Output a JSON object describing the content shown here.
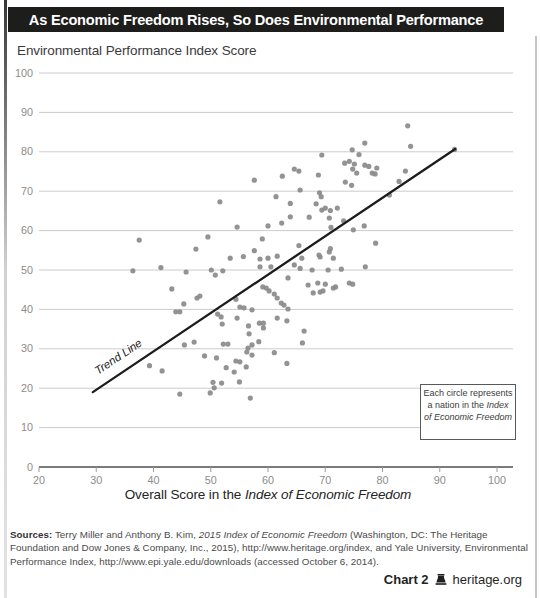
{
  "page": {
    "title": "As Economic Freedom Rises, So Does Environmental Performance",
    "subtitle": "Environmental Performance Index Score",
    "footer": {
      "chart_label": "Chart 2",
      "site": "heritage.org"
    }
  },
  "annotation": {
    "text_plain": "Each circle represents a nation in the ",
    "text_italic": "Index of Economic Freedom"
  },
  "sources": {
    "label": "Sources:",
    "seg1": " Terry Miller and Anthony B. Kim, ",
    "italic1": "2015 Index of Economic Freedom",
    "seg2": " (Washington, DC: The Heritage Foundation and Dow Jones & Company, Inc., 2015), http://www.heritage.org/index, and Yale University, Environmental Performance Index, http://www.epi.yale.edu/downloads (accessed October 6, 2014)."
  },
  "chart_data": {
    "type": "scatter",
    "title": "As Economic Freedom Rises, So Does Environmental Performance",
    "ylabel": "Environmental Performance Index Score",
    "xlabel_plain": "Overall Score in the ",
    "xlabel_italic": "Index of Economic Freedom",
    "xlim": [
      20,
      100
    ],
    "ylim": [
      0,
      100
    ],
    "x_ticks": [
      20,
      30,
      40,
      50,
      60,
      70,
      80,
      90,
      100
    ],
    "y_ticks": [
      0,
      10,
      20,
      30,
      40,
      50,
      60,
      70,
      80,
      90,
      100
    ],
    "grid": "horizontal",
    "legend": "none",
    "point_color": "#8a8a8a",
    "gridline_color": "#cccccc",
    "axis_color": "#4f4f4f",
    "tick_label_color": "#8b8b8b",
    "trend_line": {
      "label": "Trend Line",
      "x1": 29.4,
      "y1": 19.0,
      "x2": 92.7,
      "y2": 80.7,
      "color": "#1c1c1c"
    },
    "points": [
      [
        84.4,
        86.6
      ],
      [
        92.6,
        80.6
      ],
      [
        84.9,
        81.4
      ],
      [
        76.9,
        82.2
      ],
      [
        74.7,
        80.5
      ],
      [
        75.9,
        79.3
      ],
      [
        69.4,
        79.2
      ],
      [
        73.4,
        77.1
      ],
      [
        74.2,
        77.6
      ],
      [
        75.1,
        76.9
      ],
      [
        76.9,
        76.6
      ],
      [
        77.6,
        76.3
      ],
      [
        79,
        75.9
      ],
      [
        64.6,
        75.6
      ],
      [
        65.4,
        75.1
      ],
      [
        74.8,
        75.6
      ],
      [
        75.5,
        74.6
      ],
      [
        78.2,
        74.6
      ],
      [
        78.7,
        74.4
      ],
      [
        84,
        75.1
      ],
      [
        68.8,
        74.1
      ],
      [
        62.5,
        73.8
      ],
      [
        73.5,
        72.3
      ],
      [
        74.6,
        71.5
      ],
      [
        82.9,
        72.5
      ],
      [
        57.6,
        72.8
      ],
      [
        65.6,
        70.3
      ],
      [
        69,
        69.6
      ],
      [
        69.3,
        68.6
      ],
      [
        81.2,
        69
      ],
      [
        61.4,
        68.6
      ],
      [
        63.9,
        66.9
      ],
      [
        68.4,
        66.8
      ],
      [
        51.6,
        67.3
      ],
      [
        70,
        65.7
      ],
      [
        69.4,
        65.2
      ],
      [
        70.9,
        65.1
      ],
      [
        72.1,
        65.7
      ],
      [
        63.9,
        63.5
      ],
      [
        67.2,
        63.4
      ],
      [
        70.7,
        63.2
      ],
      [
        73.2,
        62.5
      ],
      [
        71,
        60.8
      ],
      [
        74.9,
        60.2
      ],
      [
        76.8,
        61.2
      ],
      [
        54.6,
        60.9
      ],
      [
        60,
        61.2
      ],
      [
        62.4,
        61.9
      ],
      [
        37.5,
        57.6
      ],
      [
        49.5,
        58.4
      ],
      [
        59,
        57.9
      ],
      [
        65.4,
        56.2
      ],
      [
        70.9,
        55.4
      ],
      [
        78.8,
        56.8
      ],
      [
        47.4,
        55.3
      ],
      [
        57.6,
        54.9
      ],
      [
        68.9,
        53.8
      ],
      [
        70.7,
        54.6
      ],
      [
        65.9,
        53
      ],
      [
        69.1,
        53.3
      ],
      [
        71.4,
        53
      ],
      [
        64.6,
        51.3
      ],
      [
        53.4,
        53
      ],
      [
        55.7,
        53.4
      ],
      [
        58.6,
        52.8
      ],
      [
        60,
        53
      ],
      [
        61.6,
        53.5
      ],
      [
        65.6,
        50.4
      ],
      [
        67.7,
        50
      ],
      [
        70.5,
        50
      ],
      [
        72.8,
        50.2
      ],
      [
        77,
        50.8
      ],
      [
        36.4,
        49.8
      ],
      [
        41.3,
        50.6
      ],
      [
        45.7,
        49.5
      ],
      [
        50.1,
        50
      ],
      [
        52.1,
        49.8
      ],
      [
        50.8,
        48.7
      ],
      [
        58.6,
        50.8
      ],
      [
        60.5,
        50.8
      ],
      [
        63.5,
        48
      ],
      [
        67,
        46.2
      ],
      [
        68.7,
        46.7
      ],
      [
        70,
        46.4
      ],
      [
        71.8,
        45.7
      ],
      [
        71.4,
        45.4
      ],
      [
        74.2,
        46.7
      ],
      [
        74.8,
        46.4
      ],
      [
        43.2,
        45.2
      ],
      [
        59.1,
        45.7
      ],
      [
        59.7,
        45.4
      ],
      [
        60.2,
        44.7
      ],
      [
        67.9,
        44.2
      ],
      [
        69.1,
        44.4
      ],
      [
        69.6,
        44.7
      ],
      [
        47.6,
        42.9
      ],
      [
        48.1,
        43.4
      ],
      [
        54.4,
        42.6
      ],
      [
        61.1,
        43.9
      ],
      [
        61.6,
        42.9
      ],
      [
        45.3,
        41.4
      ],
      [
        62.3,
        41.6
      ],
      [
        62.8,
        41.1
      ],
      [
        43.9,
        39.4
      ],
      [
        44.6,
        39.4
      ],
      [
        55.1,
        40.6
      ],
      [
        55.8,
        40.4
      ],
      [
        57.2,
        39.9
      ],
      [
        63.5,
        40.1
      ],
      [
        51.2,
        38.8
      ],
      [
        51.8,
        38.1
      ],
      [
        54.6,
        37.8
      ],
      [
        61.6,
        37.8
      ],
      [
        63.3,
        37.1
      ],
      [
        56.6,
        35.8
      ],
      [
        58.5,
        36.5
      ],
      [
        59.2,
        36.5
      ],
      [
        59.2,
        35.3
      ],
      [
        52,
        36.3
      ],
      [
        56.7,
        33.8
      ],
      [
        66.3,
        34.5
      ],
      [
        45.4,
        31
      ],
      [
        47.1,
        31.7
      ],
      [
        52.2,
        31.2
      ],
      [
        53,
        31.2
      ],
      [
        57.2,
        31
      ],
      [
        58.4,
        31.8
      ],
      [
        66,
        31.5
      ],
      [
        48.9,
        28.2
      ],
      [
        51,
        27.7
      ],
      [
        56.5,
        30.2
      ],
      [
        56.3,
        29.2
      ],
      [
        57.2,
        28.4
      ],
      [
        61.1,
        29
      ],
      [
        54.4,
        26.9
      ],
      [
        55.1,
        26.7
      ],
      [
        63.3,
        26.3
      ],
      [
        39.3,
        25.7
      ],
      [
        41.5,
        24.4
      ],
      [
        52.7,
        25.2
      ],
      [
        54.1,
        24.1
      ],
      [
        56.2,
        25.4
      ],
      [
        50.4,
        21.5
      ],
      [
        51.9,
        21.3
      ],
      [
        55,
        21.6
      ],
      [
        49.9,
        18.8
      ],
      [
        50.6,
        20.1
      ],
      [
        44.6,
        18.5
      ],
      [
        56.9,
        17.5
      ]
    ]
  }
}
